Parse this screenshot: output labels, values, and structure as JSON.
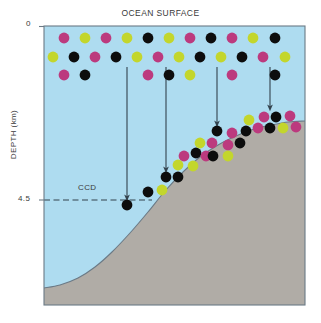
{
  "figure": {
    "title": "OCEAN SURFACE",
    "y_axis_label": "DEPTH (km)",
    "ccd_label": "CCD",
    "tick_top": "0",
    "tick_ccd": "4.5"
  },
  "colors": {
    "ocean": "#aedcf0",
    "seafloor": "#b0aca6",
    "frame": "#6b7a86",
    "magenta": "#bc3a7e",
    "green": "#c3d62c",
    "black": "#0d0d0d",
    "arrow": "#33424d",
    "text": "#3a3a3a"
  },
  "chart_data": {
    "type": "scatter",
    "title": "OCEAN SURFACE",
    "xlabel": "",
    "ylabel": "DEPTH (km)",
    "ytick_values": [
      0,
      4.5
    ],
    "ytick_labels": [
      "0",
      "4.5"
    ],
    "grid": false,
    "legend": "none",
    "annotations": [
      "CCD"
    ],
    "plot_box": {
      "x0": 44,
      "y0": 26,
      "x1": 305,
      "y1": 305
    },
    "ccd_line": {
      "y_px": 200,
      "x_start": 44,
      "x_end": 152,
      "style": "dashed",
      "depth_km": 4.5
    },
    "seafloor_curve_px": [
      [
        44,
        288
      ],
      [
        60,
        285
      ],
      [
        78,
        278
      ],
      [
        95,
        267
      ],
      [
        112,
        252
      ],
      [
        130,
        233
      ],
      [
        148,
        212
      ],
      [
        165,
        191
      ],
      [
        182,
        173
      ],
      [
        200,
        157
      ],
      [
        218,
        145
      ],
      [
        236,
        136
      ],
      [
        254,
        129
      ],
      [
        272,
        125
      ],
      [
        288,
        122
      ],
      [
        305,
        121
      ]
    ],
    "arrows_px": [
      {
        "x": 127,
        "y_from": 67,
        "y_to": 205
      },
      {
        "x": 166,
        "y_from": 67,
        "y_to": 177
      },
      {
        "x": 217,
        "y_from": 67,
        "y_to": 131
      },
      {
        "x": 270,
        "y_from": 67,
        "y_to": 115
      }
    ],
    "surface_rows_px": [
      {
        "y": 38,
        "dots": [
          {
            "x": 64,
            "c": "magenta"
          },
          {
            "x": 85,
            "c": "green"
          },
          {
            "x": 106,
            "c": "magenta"
          },
          {
            "x": 127,
            "c": "green"
          },
          {
            "x": 148,
            "c": "black"
          },
          {
            "x": 169,
            "c": "green"
          },
          {
            "x": 190,
            "c": "magenta"
          },
          {
            "x": 211,
            "c": "black"
          },
          {
            "x": 232,
            "c": "magenta"
          },
          {
            "x": 253,
            "c": "green"
          },
          {
            "x": 275,
            "c": "black"
          }
        ]
      },
      {
        "y": 57,
        "dots": [
          {
            "x": 53,
            "c": "green"
          },
          {
            "x": 74,
            "c": "black"
          },
          {
            "x": 95,
            "c": "magenta"
          },
          {
            "x": 116,
            "c": "black"
          },
          {
            "x": 137,
            "c": "green"
          },
          {
            "x": 158,
            "c": "magenta"
          },
          {
            "x": 179,
            "c": "green"
          },
          {
            "x": 200,
            "c": "black"
          },
          {
            "x": 221,
            "c": "green"
          },
          {
            "x": 242,
            "c": "black"
          },
          {
            "x": 263,
            "c": "magenta"
          },
          {
            "x": 285,
            "c": "green"
          }
        ]
      },
      {
        "y": 75,
        "dots": [
          {
            "x": 64,
            "c": "magenta"
          },
          {
            "x": 85,
            "c": "black"
          },
          {
            "x": 148,
            "c": "magenta"
          },
          {
            "x": 169,
            "c": "black"
          },
          {
            "x": 190,
            "c": "green"
          },
          {
            "x": 232,
            "c": "magenta"
          },
          {
            "x": 275,
            "c": "black"
          }
        ]
      }
    ],
    "slope_dots_px": [
      {
        "x": 127,
        "y": 205,
        "c": "black"
      },
      {
        "x": 148,
        "y": 192,
        "c": "black"
      },
      {
        "x": 166,
        "y": 177,
        "c": "black"
      },
      {
        "x": 162,
        "y": 190,
        "c": "green"
      },
      {
        "x": 178,
        "y": 165,
        "c": "green"
      },
      {
        "x": 178,
        "y": 177,
        "c": "black"
      },
      {
        "x": 184,
        "y": 156,
        "c": "magenta"
      },
      {
        "x": 196,
        "y": 153,
        "c": "black"
      },
      {
        "x": 193,
        "y": 166,
        "c": "green"
      },
      {
        "x": 200,
        "y": 143,
        "c": "green"
      },
      {
        "x": 206,
        "y": 156,
        "c": "magenta"
      },
      {
        "x": 212,
        "y": 143,
        "c": "magenta"
      },
      {
        "x": 217,
        "y": 131,
        "c": "black"
      },
      {
        "x": 213,
        "y": 156,
        "c": "black"
      },
      {
        "x": 228,
        "y": 145,
        "c": "magenta"
      },
      {
        "x": 232,
        "y": 133,
        "c": "magenta"
      },
      {
        "x": 228,
        "y": 156,
        "c": "green"
      },
      {
        "x": 240,
        "y": 143,
        "c": "black"
      },
      {
        "x": 246,
        "y": 131,
        "c": "black"
      },
      {
        "x": 249,
        "y": 120,
        "c": "green"
      },
      {
        "x": 258,
        "y": 128,
        "c": "magenta"
      },
      {
        "x": 264,
        "y": 117,
        "c": "magenta"
      },
      {
        "x": 270,
        "y": 128,
        "c": "black"
      },
      {
        "x": 276,
        "y": 117,
        "c": "black"
      },
      {
        "x": 283,
        "y": 128,
        "c": "green"
      },
      {
        "x": 290,
        "y": 116,
        "c": "magenta"
      },
      {
        "x": 296,
        "y": 127,
        "c": "magenta"
      }
    ]
  }
}
